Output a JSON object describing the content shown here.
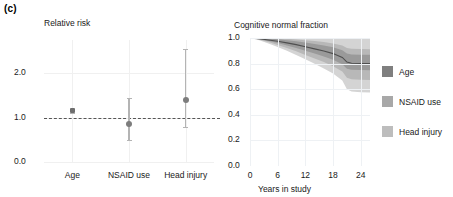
{
  "figure": {
    "panel_label": "(c)"
  },
  "chart_data": [
    {
      "type": "scatter",
      "id": "relative-risk",
      "title": "Relative risk",
      "xlabel": "",
      "ylabel": "",
      "categories": [
        "Age",
        "NSAID use",
        "Head injury"
      ],
      "values": [
        1.15,
        0.85,
        1.4
      ],
      "ci_low": [
        1.1,
        0.5,
        0.78
      ],
      "ci_high": [
        1.2,
        1.45,
        2.55
      ],
      "reference_line": 1.0,
      "ylim": [
        0.0,
        2.75
      ],
      "yticks": [
        0.0,
        1.0,
        2.0
      ],
      "ytick_labels": [
        "0.0",
        "1.0",
        "2.0"
      ],
      "grid": true,
      "marker_color": "#7d7d7d",
      "errorbar_color": "#b4b4b4",
      "refline_color": "#555555"
    },
    {
      "type": "line",
      "id": "cognitive-normal-fraction",
      "title": "Cognitive normal fraction",
      "xlabel": "Years in study",
      "ylabel": "",
      "xlim": [
        0,
        26
      ],
      "ylim": [
        0.0,
        1.0
      ],
      "xticks": [
        0,
        6,
        12,
        18,
        24
      ],
      "xtick_labels": [
        "0",
        "6",
        "12",
        "18",
        "24"
      ],
      "yticks": [
        0.0,
        0.2,
        0.4,
        0.6,
        0.8,
        1.0
      ],
      "ytick_labels": [
        "0.0",
        "0.2",
        "0.4",
        "0.6",
        "0.8",
        "1.0"
      ],
      "grid": true,
      "x": [
        0,
        2,
        4,
        6,
        8,
        10,
        12,
        14,
        16,
        18,
        20,
        21,
        22,
        24,
        26
      ],
      "mean": [
        1.0,
        0.995,
        0.985,
        0.975,
        0.962,
        0.948,
        0.932,
        0.915,
        0.898,
        0.878,
        0.848,
        0.812,
        0.803,
        0.801,
        0.8
      ],
      "band_inner_low": [
        1.0,
        0.99,
        0.976,
        0.96,
        0.942,
        0.922,
        0.9,
        0.878,
        0.856,
        0.83,
        0.795,
        0.76,
        0.752,
        0.75,
        0.749
      ],
      "band_inner_high": [
        1.0,
        1.0,
        0.996,
        0.99,
        0.982,
        0.974,
        0.964,
        0.953,
        0.942,
        0.928,
        0.905,
        0.878,
        0.872,
        0.87,
        0.869
      ],
      "band_mid_low": [
        1.0,
        0.986,
        0.968,
        0.946,
        0.922,
        0.896,
        0.868,
        0.84,
        0.812,
        0.78,
        0.738,
        0.69,
        0.678,
        0.674,
        0.672
      ],
      "band_mid_high": [
        1.0,
        1.0,
        1.0,
        0.998,
        0.994,
        0.989,
        0.983,
        0.976,
        0.968,
        0.958,
        0.942,
        0.922,
        0.916,
        0.914,
        0.913
      ],
      "band_outer_low": [
        1.0,
        0.982,
        0.958,
        0.93,
        0.9,
        0.868,
        0.834,
        0.798,
        0.762,
        0.722,
        0.668,
        0.6,
        0.582,
        0.576,
        0.574
      ],
      "band_outer_high": [
        1.0,
        1.0,
        1.0,
        1.0,
        1.0,
        1.0,
        1.0,
        1.0,
        1.0,
        1.0,
        1.0,
        1.0,
        1.0,
        1.0,
        1.0
      ],
      "line_color": "#4f4f4f",
      "band_colors": [
        "#9a9a9a",
        "#b8b8b8",
        "#d4d4d4"
      ],
      "legend": {
        "position": "right",
        "entries": [
          {
            "label": "Age",
            "color": "#7f7f7f"
          },
          {
            "label": "NSAID use",
            "color": "#a8a8a8"
          },
          {
            "label": "Head injury",
            "color": "#bdbdbd"
          }
        ]
      }
    }
  ]
}
